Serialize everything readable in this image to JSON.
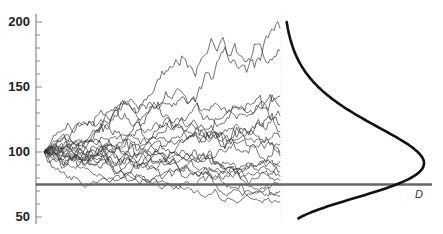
{
  "chart_data": {
    "type": "line",
    "title": "",
    "xlabel": "",
    "ylabel": "",
    "ylim": [
      50,
      200
    ],
    "yticks": [
      50,
      100,
      150,
      200
    ],
    "ytick_labels": [
      "50",
      "100",
      "150",
      "200"
    ],
    "minor_tick_step": 10,
    "grid": false,
    "legend": null,
    "paths": {
      "count": 20,
      "start_value": 100,
      "steps": 120,
      "end_values": [
        195,
        178,
        143,
        135,
        128,
        121,
        116,
        111,
        106,
        101,
        97,
        93,
        89,
        85,
        81,
        78,
        74,
        70,
        66,
        62
      ]
    },
    "barrier": {
      "label": "D",
      "value": 75
    },
    "density_curve": {
      "orientation": "vertical",
      "mode_value": 100,
      "y_range": [
        49,
        200
      ],
      "shape": "right-skewed (lognormal-like)"
    }
  },
  "axis": {
    "labels": [
      "200",
      "150",
      "100",
      "50"
    ]
  },
  "barrier_label": "D"
}
